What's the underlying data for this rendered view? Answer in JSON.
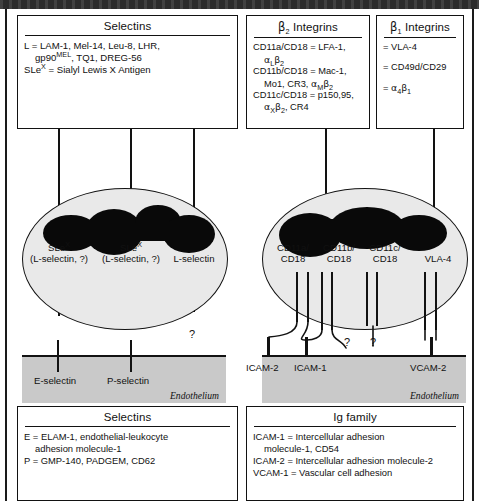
{
  "figure": {
    "endothelium_label": "Endothelium",
    "question_mark": "?"
  },
  "boxes": {
    "selectins_top": {
      "title": "Selectins",
      "lines": [
        "L = LAM-1, Mel-14, Leu-8, LHR,",
        "gp90MEL, TQ1, DREG-56",
        "SLeX = Sialyl Lewis X Antigen"
      ],
      "line1": "L = LAM-1, Mel-14, Leu-8, LHR,",
      "line2_pre": "gp90",
      "line2_sup": "MEL",
      "line2_post": ", TQ1, DREG-56",
      "line3_pre": "SLe",
      "line3_sup": "X",
      "line3_post": " = Sialyl Lewis X Antigen"
    },
    "b2_integrins": {
      "title_pre": "β",
      "title_sub": "2",
      "title_post": " Integrins",
      "l1": "CD11a/CD18 =  LFA-1,",
      "l2_a": "α",
      "l2_asub": "L",
      "l2_b": "β",
      "l2_bsub": "2",
      "l3": "CD11b/CD18 = Mac-1,",
      "l4_pre": "Mo1, CR3, ",
      "l4_a": "α",
      "l4_asub": "M",
      "l4_b": "β",
      "l4_bsub": "2",
      "l5": "CD11c/CD18 = p150,95,",
      "l6_a": "α",
      "l6_asub": "X",
      "l6_b": "β",
      "l6_bsub": "2",
      "l6_post": ", CR4"
    },
    "b1_integrins": {
      "title_pre": "β",
      "title_sub": "1",
      "title_post": " Integrins",
      "l1": "= VLA-4",
      "l2": "= CD49d/CD29",
      "l3_pre": "= ",
      "l3_a": "α",
      "l3_asub": "4",
      "l3_b": "β",
      "l3_bsub": "1"
    },
    "selectins_bottom": {
      "title": "Selectins",
      "l1": "E = ELAM-1, endothelial-leukocyte",
      "l2": "adhesion molecule-1",
      "l3": "P = GMP-140, PADGEM, CD62"
    },
    "ig_family": {
      "title": "Ig family",
      "l1": "ICAM-1 = Intercellular adhesion",
      "l2": "molecule-1, CD54",
      "l3": "ICAM-2 = Intercellular adhesion molecule-2",
      "l4": "VCAM-1 = Vascular cell adhesion"
    }
  },
  "leukocyte_left": {
    "receptors": [
      {
        "top_pre": "SLe",
        "top_sup": "X",
        "bottom": "(L-selectin, ?)"
      },
      {
        "top_pre": "SLe",
        "top_sup": "X",
        "bottom": "(L-selectin, ?)"
      },
      {
        "top_pre": "",
        "top_sup": "",
        "bottom": "L-selectin"
      }
    ]
  },
  "leukocyte_right": {
    "receptors": [
      {
        "top": "CD11a/",
        "bottom": "CD18"
      },
      {
        "top": "CD11b/",
        "bottom": "CD18"
      },
      {
        "top": "CD11c/",
        "bottom": "CD18"
      },
      {
        "top": "",
        "bottom": "VLA-4"
      }
    ]
  },
  "endothelium_left": {
    "ligands": [
      "E-selectin",
      "P-selectin"
    ],
    "label": "Endothelium"
  },
  "endothelium_right": {
    "ligands": [
      "ICAM-2",
      "ICAM-1",
      "VCAM-2"
    ],
    "label": "Endothelium"
  },
  "colors": {
    "cell_fill": "#e9e9e9",
    "nucleus": "#090909",
    "endothelium": "#c9c9c9",
    "stroke": "#121212"
  }
}
